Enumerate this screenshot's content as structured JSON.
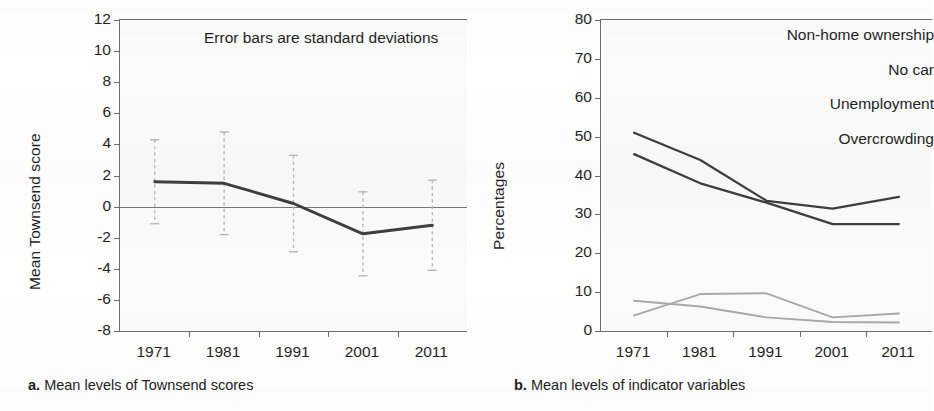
{
  "figure": {
    "panels": [
      {
        "id": "a",
        "caption_letter": "a.",
        "caption_text": "Mean levels of Townsend scores",
        "annotation": "Error bars are standard deviations",
        "ylabel": "Mean Townsend score",
        "yticks": [
          "12",
          "10",
          "8",
          "6",
          "4",
          "2",
          "0",
          "-2",
          "-4",
          "-6",
          "-8"
        ],
        "xticks": [
          "1971",
          "1981",
          "1991",
          "2001",
          "2011"
        ]
      },
      {
        "id": "b",
        "caption_letter": "b.",
        "caption_text": "Mean levels of indicator variables",
        "ylabel": "Percentages",
        "yticks": [
          "80",
          "70",
          "60",
          "50",
          "40",
          "30",
          "20",
          "10",
          "0"
        ],
        "xticks": [
          "1971",
          "1981",
          "1991",
          "2001",
          "2011"
        ],
        "legend": [
          "Non-home ownership",
          "No car",
          "Unemployment",
          "Overcrowding"
        ]
      }
    ]
  },
  "colors": {
    "dark_line": "#3f3f3f",
    "light_line": "#a9a9a9",
    "errorbar": "#b4b4b4",
    "axis": "#6e6e6e",
    "zero_line": "#777777",
    "text": "#1f1f1f",
    "plot_background": "#fbfbfb"
  },
  "chart_data": [
    {
      "type": "line",
      "panel": "a",
      "title": "",
      "annotation": "Error bars are standard deviations",
      "xlabel": "",
      "ylabel": "Mean Townsend score",
      "categories": [
        "1971",
        "1981",
        "1991",
        "2001",
        "2011"
      ],
      "ylim": [
        -8,
        12
      ],
      "ytick_step": 2,
      "grid": false,
      "legend_position": "none",
      "zero_line": 0,
      "series": [
        {
          "name": "Mean Townsend score",
          "color": "#3f3f3f",
          "values": [
            1.6,
            1.5,
            0.2,
            -1.75,
            -1.2
          ],
          "errors_sd": [
            2.7,
            3.3,
            3.1,
            2.7,
            2.9
          ],
          "error_upper": [
            4.3,
            4.8,
            3.3,
            0.95,
            1.7
          ],
          "error_lower": [
            -1.1,
            -1.8,
            -2.9,
            -4.45,
            -4.1
          ]
        }
      ]
    },
    {
      "type": "line",
      "panel": "b",
      "title": "",
      "xlabel": "",
      "ylabel": "Percentages",
      "categories": [
        "1971",
        "1981",
        "1991",
        "2001",
        "2011"
      ],
      "ylim": [
        0,
        80
      ],
      "ytick_step": 10,
      "grid": false,
      "legend_position": "top-right",
      "series": [
        {
          "name": "Non-home ownership",
          "color": "#3f3f3f",
          "values": [
            51,
            44,
            33.5,
            31.5,
            34.5
          ]
        },
        {
          "name": "No car",
          "color": "#3f3f3f",
          "values": [
            45.5,
            38,
            33,
            27.5,
            27.5
          ]
        },
        {
          "name": "Unemployment",
          "color": "#a9a9a9",
          "values": [
            4,
            9.5,
            9.7,
            3.5,
            4.5
          ]
        },
        {
          "name": "Overcrowding",
          "color": "#a9a9a9",
          "values": [
            7.8,
            6.3,
            3.5,
            2.3,
            2.2
          ]
        }
      ]
    }
  ]
}
